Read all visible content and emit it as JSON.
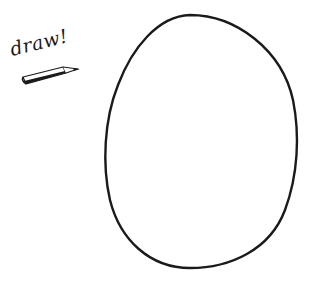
{
  "prompt": {
    "label": "draw!"
  },
  "icons": {
    "pencil": "pencil-icon"
  },
  "drawing": {
    "shape": "oval",
    "stroke_color": "#1a1a1a",
    "background": "#ffffff"
  }
}
